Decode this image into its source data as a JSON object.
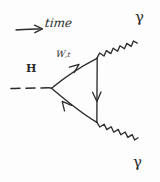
{
  "diagram": {
    "kind": "feynman-diagram",
    "style": "hand-drawn sketch",
    "ink_color": "#2b2b2b",
    "background_color": "#fdfdfd"
  },
  "annotations": {
    "time_arrow_label": "time",
    "time_arrow_direction": "left-to-right"
  },
  "particles": {
    "higgs": {
      "label": "H",
      "line_style": "dashed",
      "dash_count": 3
    },
    "loop": {
      "label_main": "W",
      "label_separator": ",",
      "label_secondary": "t",
      "label_full": "W,t",
      "line_style": "solid",
      "shape": "triangle",
      "arrow_direction": "counterclockwise",
      "arrow_count": 3
    },
    "photon_top": {
      "label": "γ",
      "line_style": "wavy",
      "direction": "upper-right"
    },
    "photon_bottom": {
      "label": "γ",
      "line_style": "wavy",
      "direction": "lower-right"
    }
  },
  "vertices": {
    "higgs_vertex": "left",
    "photon_vertex_top": "upper-right",
    "photon_vertex_bottom": "lower-right"
  }
}
